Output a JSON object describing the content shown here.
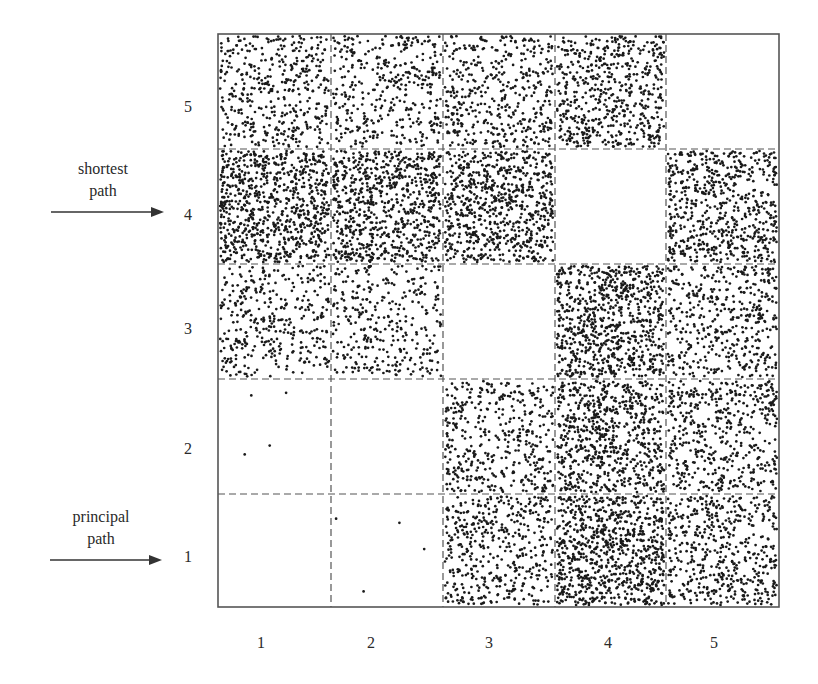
{
  "chart_data": {
    "type": "scatter",
    "title": "",
    "xlabel": "",
    "ylabel": "",
    "x_categories": [
      "1",
      "2",
      "3",
      "4",
      "5"
    ],
    "y_categories": [
      "1",
      "2",
      "3",
      "4",
      "5"
    ],
    "grid": "dashed 5x5 cells",
    "cells": [
      {
        "x": 1,
        "y": 5,
        "density": 420
      },
      {
        "x": 2,
        "y": 5,
        "density": 380
      },
      {
        "x": 3,
        "y": 5,
        "density": 430
      },
      {
        "x": 4,
        "y": 5,
        "density": 560
      },
      {
        "x": 5,
        "y": 5,
        "density": 0
      },
      {
        "x": 1,
        "y": 4,
        "density": 800
      },
      {
        "x": 2,
        "y": 4,
        "density": 760
      },
      {
        "x": 3,
        "y": 4,
        "density": 740
      },
      {
        "x": 4,
        "y": 4,
        "density": 0
      },
      {
        "x": 5,
        "y": 4,
        "density": 620
      },
      {
        "x": 1,
        "y": 3,
        "density": 360
      },
      {
        "x": 2,
        "y": 3,
        "density": 330
      },
      {
        "x": 3,
        "y": 3,
        "density": 0
      },
      {
        "x": 4,
        "y": 3,
        "density": 780
      },
      {
        "x": 5,
        "y": 3,
        "density": 450
      },
      {
        "x": 1,
        "y": 2,
        "density": 4
      },
      {
        "x": 2,
        "y": 2,
        "density": 0
      },
      {
        "x": 3,
        "y": 2,
        "density": 420
      },
      {
        "x": 4,
        "y": 2,
        "density": 700
      },
      {
        "x": 5,
        "y": 2,
        "density": 480
      },
      {
        "x": 1,
        "y": 1,
        "density": 0
      },
      {
        "x": 2,
        "y": 1,
        "density": 4
      },
      {
        "x": 3,
        "y": 1,
        "density": 440
      },
      {
        "x": 4,
        "y": 1,
        "density": 820
      },
      {
        "x": 5,
        "y": 1,
        "density": 500
      }
    ],
    "annotations": [
      {
        "text_line1": "shortest",
        "text_line2": "path",
        "points_to_row": "4"
      },
      {
        "text_line1": "principal",
        "text_line2": "path",
        "points_to_row": "1"
      }
    ],
    "legend": "none"
  },
  "labels": {
    "rows": [
      "5",
      "4",
      "3",
      "2",
      "1"
    ],
    "cols": [
      "1",
      "2",
      "3",
      "4",
      "5"
    ],
    "shortest_l1": "shortest",
    "shortest_l2": "path",
    "principal_l1": "principal",
    "principal_l2": "path"
  },
  "colors": {
    "dot": "#1a1a1a",
    "frame": "#555555",
    "grid": "#555555",
    "background": "#ffffff"
  }
}
